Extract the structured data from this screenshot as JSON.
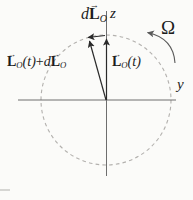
{
  "figure": {
    "axis_labels": {
      "z": "z",
      "y": "y"
    },
    "omega_label": "Ω",
    "vec_arrow_glyph": "→",
    "dL_label": {
      "d": "d",
      "L": "L",
      "sub": "O"
    },
    "L_plus_dL_label": {
      "L": "L",
      "sub": "O",
      "t": "(t)",
      "plus": "+",
      "d": "d",
      "L2": "L",
      "sub2": "O"
    },
    "L_t_label": {
      "L": "L",
      "sub": "O",
      "t": "(t)"
    },
    "colors": {
      "paper": "#fbfbf9",
      "ink": "#2a2a2a",
      "axis": "#6e6e6e",
      "dashed_circle": "#b3b1ae",
      "omega_curve": "#5a5a5a"
    }
  }
}
